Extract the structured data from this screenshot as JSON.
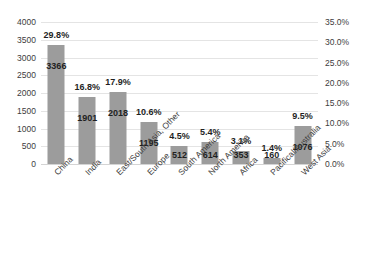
{
  "chart_data": {
    "type": "bar",
    "title": "",
    "xlabel": "",
    "ylabel": "",
    "categories": [
      "China",
      "India",
      "East/South Asia, Other",
      "Europe",
      "South America",
      "North America",
      "Africa",
      "Pacifical/Australia",
      "West Asia"
    ],
    "values": [
      3366,
      1901,
      2018,
      1195,
      512,
      614,
      353,
      160,
      1076
    ],
    "value_labels": [
      "3366",
      "1901",
      "2018",
      "1195",
      "512",
      "614",
      "353",
      "160",
      "1076"
    ],
    "percent_values": [
      29.8,
      16.8,
      17.9,
      10.6,
      4.5,
      5.4,
      3.1,
      1.4,
      9.5
    ],
    "percent_labels": [
      "29.8%",
      "16.8%",
      "17.9%",
      "10.6%",
      "4.5%",
      "5.4%",
      "3.1%",
      "1.4%",
      "9.5%"
    ],
    "ylim": [
      0,
      4000
    ],
    "yticks": [
      0,
      500,
      1000,
      1500,
      2000,
      2500,
      3000,
      3500,
      4000
    ],
    "ytick_labels": [
      "0",
      "500",
      "1000",
      "1500",
      "2000",
      "2500",
      "3000",
      "3500",
      "4000"
    ],
    "ylim_right": [
      0,
      35
    ],
    "yticks_right": [
      0,
      5,
      10,
      15,
      20,
      25,
      30,
      35
    ],
    "ytick_labels_right": [
      "0.0%",
      "5.0%",
      "10.0%",
      "15.0%",
      "20.0%",
      "25.0%",
      "30.0%",
      "35.0%"
    ],
    "grid": true,
    "legend": "none",
    "bar_color": "#9c9c9c",
    "gridline_color": "#e4e4e4",
    "label_color": "#1f1f1f"
  },
  "cropped_title_sliver": " "
}
